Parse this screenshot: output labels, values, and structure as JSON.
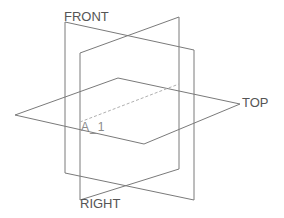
{
  "diagram": {
    "type": "datum-planes",
    "planes": [
      {
        "name": "FRONT",
        "points": [
          [
            65,
            22
          ],
          [
            194,
            50
          ],
          [
            194,
            200
          ],
          [
            65,
            173
          ]
        ]
      },
      {
        "name": "RIGHT",
        "points": [
          [
            80,
            53
          ],
          [
            179,
            17
          ],
          [
            179,
            169
          ],
          [
            80,
            200
          ]
        ]
      },
      {
        "name": "TOP",
        "points": [
          [
            15,
            115
          ],
          [
            118,
            78
          ],
          [
            240,
            104
          ],
          [
            144,
            144
          ]
        ]
      }
    ],
    "axis": {
      "name": "A_1",
      "from": [
        80,
        122
      ],
      "to": [
        179,
        84
      ]
    },
    "labels": {
      "front": "FRONT",
      "right": "RIGHT",
      "top": "TOP",
      "axis": "A_1"
    },
    "colors": {
      "plane_stroke": "#7a7a7a",
      "axis_stroke": "#b0b0b0",
      "label": "#555555"
    }
  }
}
